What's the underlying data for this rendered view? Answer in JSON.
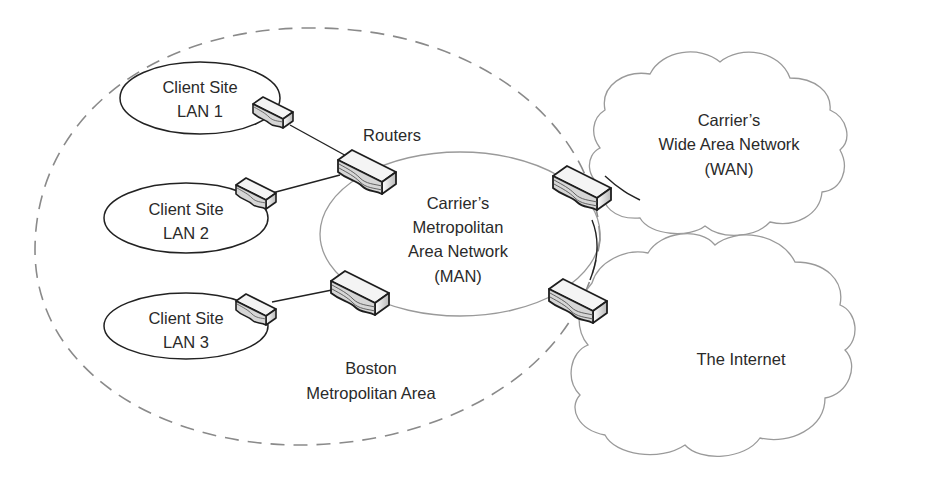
{
  "diagram": {
    "region_label": {
      "line1": "Boston",
      "line2": "Metropolitan Area"
    },
    "routers_label": "Routers",
    "lans": [
      {
        "line1": "Client Site",
        "line2": "LAN 1"
      },
      {
        "line1": "Client Site",
        "line2": "LAN 2"
      },
      {
        "line1": "Client Site",
        "line2": "LAN 3"
      }
    ],
    "man": {
      "line1": "Carrier’s",
      "line2": "Metropolitan",
      "line3": "Area Network",
      "line4": "(MAN)"
    },
    "wan": {
      "line1": "Carrier’s",
      "line2": "Wide Area Network",
      "line3": "(WAN)"
    },
    "internet": {
      "line1": "The Internet"
    },
    "colors": {
      "line": "#222222",
      "cloud_stroke": "#9a9a9a",
      "dashed_boundary": "#8a8a8a",
      "man_stroke": "#9a9a9a",
      "text": "#2a2a2a",
      "router_top": "#f4f4f4",
      "router_side": "#d8d8d8"
    }
  }
}
